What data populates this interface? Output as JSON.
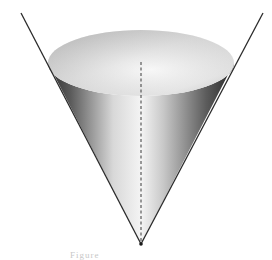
{
  "diagram": {
    "shapes": {
      "top_surface": {
        "type": "ellipse",
        "cx": 141,
        "cy": 63,
        "rx": 93,
        "ry": 33
      },
      "apex": {
        "x": 141,
        "y": 244
      },
      "axis": {
        "style": "dashed",
        "from": [
          141,
          62
        ],
        "to": [
          141,
          244
        ]
      },
      "extended_generator_left": {
        "from": [
          21,
          13
        ],
        "to": [
          141,
          244
        ]
      },
      "extended_generator_right": {
        "from": [
          263,
          13
        ],
        "to": [
          141,
          244
        ]
      }
    },
    "colors": {
      "background": "#ffffff",
      "lines": "#2a2a2a",
      "surface_light": "#f2f2f2",
      "surface_dark": "#3a3a3a",
      "top_light": "#f4f4f4",
      "top_dark": "#b8b8b8"
    }
  },
  "caption": {
    "text": "Figure"
  }
}
